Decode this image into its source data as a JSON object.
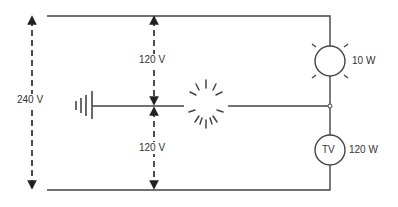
{
  "diagram": {
    "type": "three-wire split-phase circuit",
    "colors": {
      "line": "#444444",
      "text": "#333333",
      "background": "#ffffff"
    },
    "voltages": {
      "total": "240 V",
      "upper_half": "120 V",
      "lower_half": "120 V"
    },
    "loads": [
      {
        "name": "lamp",
        "symbol": "lamp-icon",
        "label": "10 W"
      },
      {
        "name": "tv",
        "symbol": "tv-icon",
        "inner_label": "TV",
        "label": "120 W"
      }
    ],
    "neutral": {
      "symbol": "ground-icon",
      "fault": "broken-neutral-burst-icon"
    }
  }
}
